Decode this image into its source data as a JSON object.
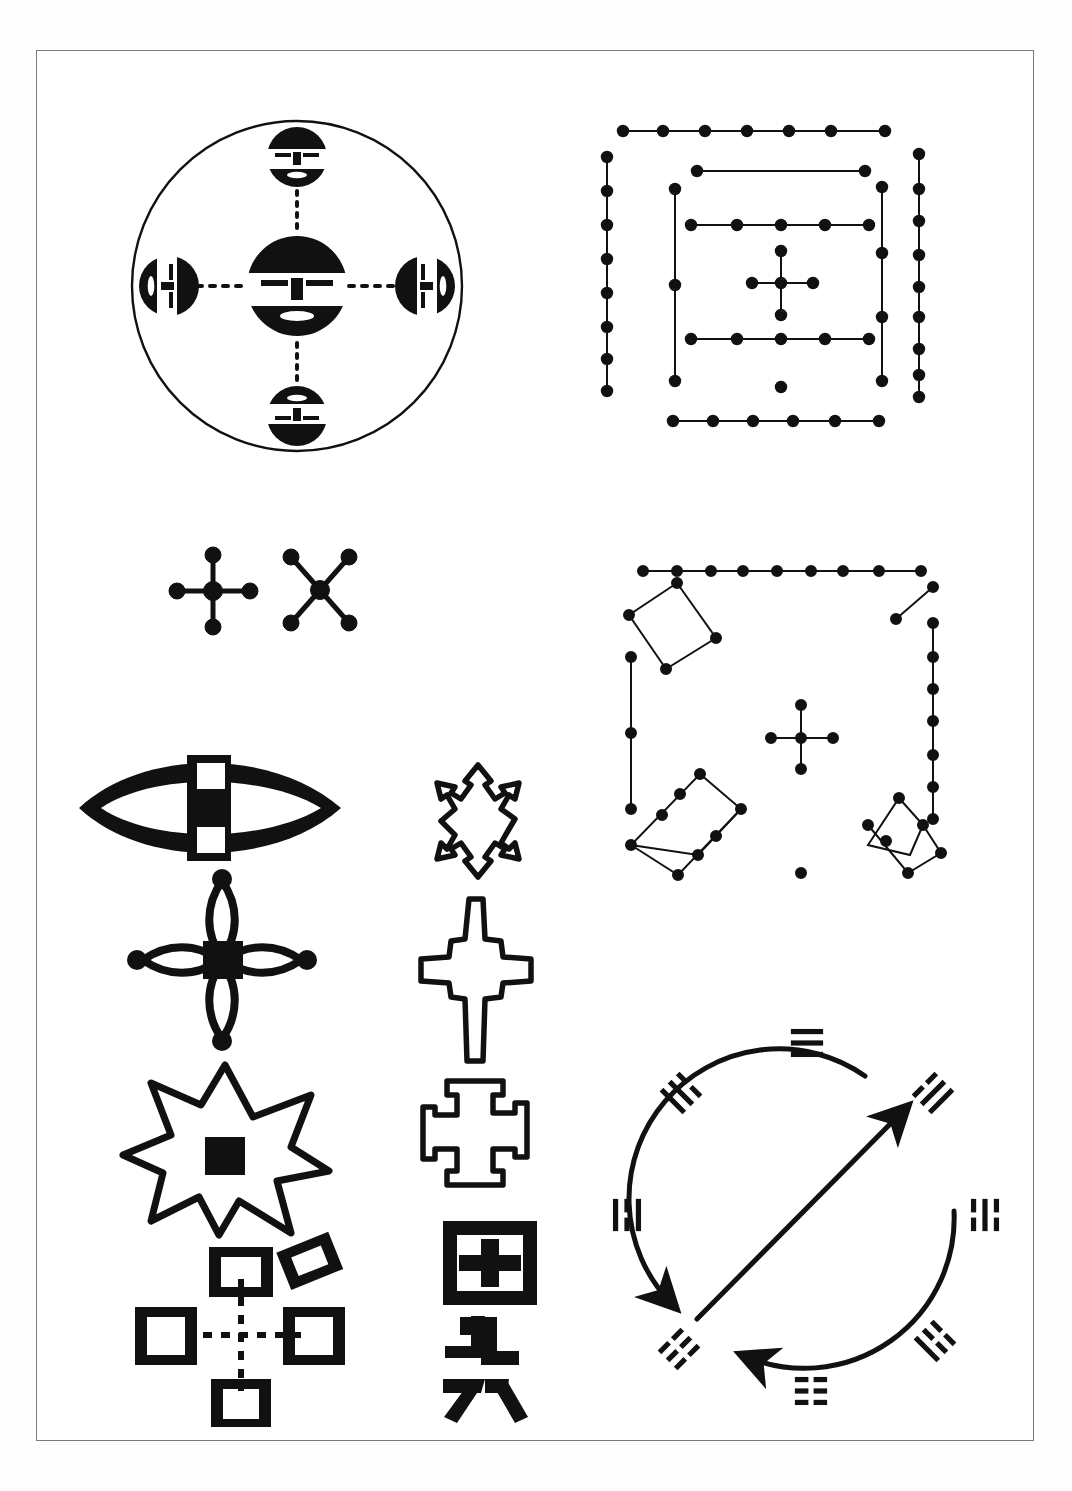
{
  "figure": {
    "background_color": "#ffffff",
    "ink_color": "#111111",
    "frame_color": "#7b7b7b",
    "width": 1072,
    "height": 1491
  },
  "panels": [
    {
      "id": "quincunx-faces",
      "label": "Quincunx of five faces in a circle",
      "position": {
        "x": 118,
        "y": 92,
        "w": 370,
        "h": 390
      },
      "description": "Large outline circle enclosing a central solid face disc with four smaller face discs at cardinal points, joined by dotted axes",
      "faces": [
        {
          "name": "center-face",
          "direction": "center",
          "diameter": 148,
          "orientation": "upright"
        },
        {
          "name": "north-face",
          "direction": "north",
          "diameter": 88,
          "orientation": "upright"
        },
        {
          "name": "south-face",
          "direction": "south",
          "diameter": 88,
          "orientation": "inverted"
        },
        {
          "name": "west-face",
          "direction": "west",
          "diameter": 88,
          "orientation": "rotated-90-cw"
        },
        {
          "name": "east-face",
          "direction": "east",
          "diameter": 88,
          "orientation": "rotated-90-ccw"
        }
      ],
      "axes": [
        "vertical-dotted",
        "horizontal-dotted"
      ]
    },
    {
      "id": "dot-plan-concentric",
      "label": "Concentric dotted rectangle plan with central cross",
      "position": {
        "x": 608,
        "y": 112,
        "w": 340,
        "h": 340
      },
      "description": "Nested rectangular rows of dots connected by lines, with a five-dot cross at centre and an isolated dot below it",
      "dot_count_approx": 62,
      "center_motif": "five-dot-cross"
    },
    {
      "id": "cross-and-saltire",
      "label": "Dotted cross and saltire pair",
      "position": {
        "x": 160,
        "y": 540,
        "w": 200,
        "h": 100
      },
      "shapes": [
        {
          "name": "greek-cross-quincunx",
          "arms": 4,
          "terminals": "round knobs"
        },
        {
          "name": "saltire-quincunx",
          "arms": 4,
          "terminals": "round knobs"
        }
      ]
    },
    {
      "id": "dot-plan-rotated-squares",
      "label": "Site plan of dotted square enclosures with central cross",
      "position": {
        "x": 610,
        "y": 556,
        "w": 350,
        "h": 340
      },
      "enclosures": 4,
      "center_motif": "five-dot-cross",
      "isolated_dots": 1
    },
    {
      "id": "lens-with-cross",
      "label": "Solid lens (vesica) containing a white cross band",
      "position": {
        "x": 72,
        "y": 752,
        "w": 265,
        "h": 110
      }
    },
    {
      "id": "four-petal-rosette",
      "label": "Four-petal open rosette with solid centre square",
      "position": {
        "x": 125,
        "y": 868,
        "w": 195,
        "h": 170
      }
    },
    {
      "id": "eight-point-star",
      "label": "Eight-pointed outline star with solid centre square",
      "position": {
        "x": 122,
        "y": 1062,
        "w": 210,
        "h": 170
      }
    },
    {
      "id": "four-squares-quincunx",
      "label": "Four open squares joined by dashed cross axes plus a tilted square",
      "position": {
        "x": 118,
        "y": 1228,
        "w": 235,
        "h": 180
      },
      "squares": 4,
      "extra_tilted_square": 1,
      "axes": [
        "vertical-dashed",
        "horizontal-dashed"
      ]
    },
    {
      "id": "stepped-lozenge-cross",
      "label": "Stepped outline lozenge cross",
      "position": {
        "x": 418,
        "y": 760,
        "w": 118,
        "h": 115
      }
    },
    {
      "id": "spiked-cross",
      "label": "Outline cross with tapering spiked arms",
      "position": {
        "x": 412,
        "y": 895,
        "w": 120,
        "h": 165
      }
    },
    {
      "id": "bracket-cross",
      "label": "Outline cross with bracketed arm ends",
      "position": {
        "x": 412,
        "y": 1078,
        "w": 110,
        "h": 115
      }
    },
    {
      "id": "chinese-characters",
      "label": "Two Chinese glyphs drawn as motifs",
      "position": {
        "x": 430,
        "y": 1218,
        "w": 110,
        "h": 200
      },
      "glyphs": [
        {
          "char": "田",
          "reading": "tian",
          "meaning": "field"
        },
        {
          "char": "六",
          "reading": "liu",
          "meaning": "six"
        }
      ]
    },
    {
      "id": "trigram-circle",
      "label": "Circle of eight I Ching trigrams with crossed directional arrows",
      "position": {
        "x": 612,
        "y": 1025,
        "w": 390,
        "h": 390
      },
      "arrows": [
        {
          "name": "outer-arc-arrow-ccw",
          "from": "top",
          "to": "lower-left"
        },
        {
          "name": "outer-arc-arrow-ccw-lower",
          "from": "lower-right",
          "to": "bottom-left"
        },
        {
          "name": "diagonal-arrow",
          "from": "lower-left",
          "to": "upper-right"
        }
      ],
      "trigrams": [
        {
          "position": "top",
          "name": "Qian",
          "glyph": "☰",
          "lines": "111",
          "angle": 0
        },
        {
          "position": "upper-right",
          "name": "Xun",
          "glyph": "☴",
          "lines": "011",
          "angle": 45
        },
        {
          "position": "right",
          "name": "Kan",
          "glyph": "☵",
          "lines": "010",
          "angle": 90
        },
        {
          "position": "lower-right",
          "name": "Gen",
          "glyph": "☶",
          "lines": "001",
          "angle": 135
        },
        {
          "position": "bottom",
          "name": "Kun",
          "glyph": "☷",
          "lines": "000",
          "angle": 180
        },
        {
          "position": "lower-left",
          "name": "Zhen",
          "glyph": "☳",
          "lines": "100",
          "angle": 225
        },
        {
          "position": "left",
          "name": "Li",
          "glyph": "☲",
          "lines": "101",
          "angle": 270
        },
        {
          "position": "upper-left",
          "name": "Dui",
          "glyph": "☱",
          "lines": "110",
          "angle": 315
        }
      ]
    }
  ]
}
